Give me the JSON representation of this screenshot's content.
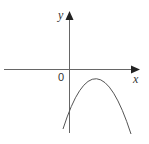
{
  "diagram": {
    "type": "function-graph",
    "axes": {
      "x_label": "x",
      "y_label": "y",
      "origin_label": "0"
    },
    "curve": {
      "shape": "parabola",
      "opens": "down",
      "vertex_position": "right of y-axis, below x-axis",
      "y_intercept": "negative",
      "color": "#555555"
    },
    "colors": {
      "axis": "#666666",
      "curve": "#555555",
      "text": "#333333",
      "background": "#ffffff"
    }
  }
}
